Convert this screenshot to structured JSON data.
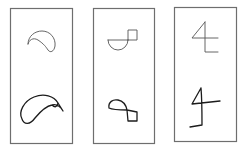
{
  "figure": {
    "panels": [
      {
        "id": "panel-1",
        "top_shape": "teardrop-curve",
        "bottom_shape": "teardrop-curve-reproduction"
      },
      {
        "id": "panel-2",
        "top_shape": "semicircle-with-square",
        "bottom_shape": "loop-with-square-reproduction"
      },
      {
        "id": "panel-3",
        "top_shape": "numeral-four-like",
        "bottom_shape": "numeral-four-reproduction"
      }
    ],
    "colors": {
      "frame": "#6e6e6e",
      "template_stroke": "#555555",
      "drawn_stroke": "#1c1c1c",
      "background": "#ffffff"
    }
  }
}
